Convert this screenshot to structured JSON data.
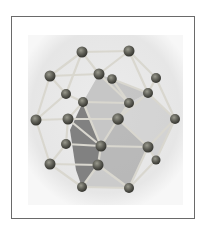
{
  "figure": {
    "colors": {
      "frame_border": "#6a6a6a",
      "photo_background": "#e9e9e9",
      "stick": "#d8d6cf",
      "ball": "#5a5a52",
      "ball_highlight": "#8a8a80",
      "face_dark": "#6e6e6e",
      "face_medium": "#9a9a9a",
      "face_light": "#bdbdbd"
    },
    "atoms": [
      [
        82,
        52
      ],
      [
        129,
        51
      ],
      [
        50,
        76
      ],
      [
        99,
        74
      ],
      [
        112,
        79
      ],
      [
        156,
        78
      ],
      [
        66,
        94
      ],
      [
        148,
        93
      ],
      [
        83,
        102
      ],
      [
        129,
        103
      ],
      [
        36,
        120
      ],
      [
        68,
        119
      ],
      [
        118,
        119
      ],
      [
        175,
        119
      ],
      [
        66,
        144
      ],
      [
        101,
        146
      ],
      [
        148,
        147
      ],
      [
        50,
        164
      ],
      [
        98,
        165
      ],
      [
        156,
        160
      ],
      [
        82,
        187
      ],
      [
        129,
        188
      ]
    ]
  }
}
